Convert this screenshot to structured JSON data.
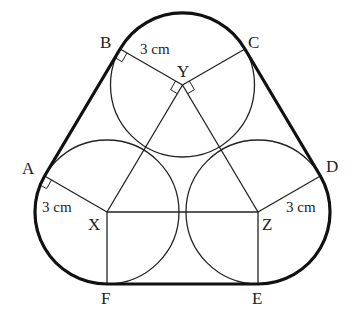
{
  "diagram": {
    "points": {
      "A": "A",
      "B": "B",
      "C": "C",
      "D": "D",
      "E": "E",
      "F": "F",
      "X": "X",
      "Y": "Y",
      "Z": "Z"
    },
    "dimensions": {
      "BY": "3 cm",
      "AX": "3 cm",
      "ZD": "3 cm"
    },
    "colors": {
      "stroke": "#222222",
      "background": "#ffffff"
    }
  }
}
